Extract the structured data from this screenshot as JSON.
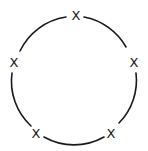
{
  "diagram": {
    "type": "cycle",
    "colors": {
      "stroke": "#1a1a1a",
      "background": "#ffffff"
    },
    "circle": {
      "cx": 74,
      "cy": 80,
      "r": 61
    },
    "nodes": [
      {
        "id": "n1",
        "label": "X",
        "x": 76,
        "y": 15
      },
      {
        "id": "n2",
        "label": "X",
        "x": 134,
        "y": 62
      },
      {
        "id": "n3",
        "label": "X",
        "x": 111,
        "y": 133
      },
      {
        "id": "n4",
        "label": "X",
        "x": 36,
        "y": 133
      },
      {
        "id": "n5",
        "label": "X",
        "x": 14,
        "y": 62
      }
    ]
  }
}
